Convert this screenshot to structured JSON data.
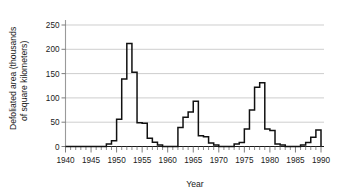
{
  "chart_data": {
    "type": "line",
    "subtype": "step",
    "title": "",
    "xlabel": "Year",
    "ylabel": "Defoliated area (thousands of square kilometers)",
    "ylabel_line1": "Defoliated area (thousands",
    "ylabel_line2": "of square kilometers)",
    "xlim": [
      1940,
      1990
    ],
    "ylim": [
      0,
      265
    ],
    "x_tick_labels": [
      "1940",
      "1945",
      "1950",
      "1955",
      "1960",
      "1965",
      "1970",
      "1975",
      "1980",
      "1985",
      "1990"
    ],
    "x_major_ticks": [
      1940,
      1945,
      1950,
      1955,
      1960,
      1965,
      1970,
      1975,
      1980,
      1985,
      1990
    ],
    "x_minor_tick_interval": 1,
    "y_tick_labels": [
      "0",
      "50",
      "100",
      "150",
      "200",
      "250"
    ],
    "y_major_ticks": [
      0,
      50,
      100,
      150,
      200,
      250
    ],
    "grid": "horizontal",
    "legend": "none",
    "line_color": "#111111",
    "grid_color": "#b9b9b9",
    "axis_color": "#9a9a9a",
    "x": [
      1940,
      1941,
      1942,
      1943,
      1944,
      1945,
      1946,
      1947,
      1948,
      1949,
      1950,
      1951,
      1952,
      1953,
      1954,
      1955,
      1956,
      1957,
      1958,
      1959,
      1960,
      1961,
      1962,
      1963,
      1964,
      1965,
      1966,
      1967,
      1968,
      1969,
      1970,
      1971,
      1972,
      1973,
      1974,
      1975,
      1976,
      1977,
      1978,
      1979,
      1980,
      1981,
      1982,
      1983,
      1984,
      1985,
      1986,
      1987,
      1988,
      1989,
      1990
    ],
    "values": [
      0,
      0,
      0,
      0,
      0,
      0,
      0,
      0,
      5,
      12,
      56,
      139,
      212,
      153,
      49,
      48,
      17,
      9,
      3,
      0,
      0,
      0,
      39,
      60,
      71,
      93,
      22,
      20,
      7,
      3,
      0,
      0,
      0,
      5,
      8,
      36,
      75,
      122,
      131,
      36,
      33,
      5,
      3,
      0,
      0,
      0,
      3,
      8,
      19,
      34,
      0
    ],
    "series_name": "Defoliated area",
    "annotations": []
  },
  "axis": {
    "y_title_line1": "Defoliated area (thousands",
    "y_title_line2": "of square kilometers)",
    "x_title": "Year"
  }
}
